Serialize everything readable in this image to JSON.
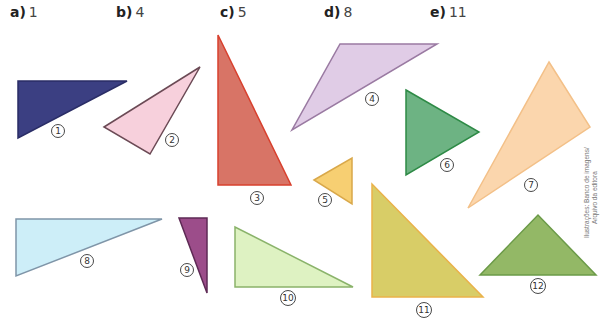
{
  "answers": [
    {
      "letter": "a)",
      "value": "1"
    },
    {
      "letter": "b)",
      "value": "4"
    },
    {
      "letter": "c)",
      "value": "5"
    },
    {
      "letter": "d)",
      "value": "8"
    },
    {
      "letter": "e)",
      "value": "11"
    }
  ],
  "triangles": [
    {
      "id": "1",
      "fill": "#3b3f82",
      "stroke": "#2a2d66",
      "points": "18,81 127,81 18,138",
      "label_x": 58,
      "label_y": 131
    },
    {
      "id": "2",
      "fill": "#f7d0dc",
      "stroke": "#6b4a55",
      "points": "104,127 200,67 150,154",
      "label_x": 172,
      "label_y": 140
    },
    {
      "id": "3",
      "fill": "#d87466",
      "stroke": "#d8402e",
      "points": "218,35 218,185 291,185",
      "label_x": 257,
      "label_y": 198
    },
    {
      "id": "4",
      "fill": "#e0cce6",
      "stroke": "#9a7aa2",
      "points": "340,44 437,44 292,130",
      "label_x": 372,
      "label_y": 99
    },
    {
      "id": "5",
      "fill": "#f7cf72",
      "stroke": "#d9a84a",
      "points": "314,180 352,158 352,204",
      "label_x": 325,
      "label_y": 200
    },
    {
      "id": "6",
      "fill": "#6db383",
      "stroke": "#2e8a46",
      "points": "406,90 479,132 406,175",
      "label_x": 447,
      "label_y": 165
    },
    {
      "id": "7",
      "fill": "#fbd6ad",
      "stroke": "#f3c088",
      "points": "549,62 590,127 468,208",
      "label_x": 531,
      "label_y": 185
    },
    {
      "id": "8",
      "fill": "#cdeef8",
      "stroke": "#7f95a8",
      "points": "16,219 162,219 16,276",
      "label_x": 87,
      "label_y": 261
    },
    {
      "id": "9",
      "fill": "#9c4d8a",
      "stroke": "#5e2a55",
      "points": "179,218 207,218 207,293",
      "label_x": 187,
      "label_y": 270
    },
    {
      "id": "10",
      "fill": "#def2c2",
      "stroke": "#8ab36a",
      "points": "235,227 235,287 353,287",
      "label_x": 288,
      "label_y": 298
    },
    {
      "id": "11",
      "fill": "#d8cd67",
      "stroke": "#eab24a",
      "points": "372,184 372,297 483,297",
      "label_x": 424,
      "label_y": 310
    },
    {
      "id": "12",
      "fill": "#93b866",
      "stroke": "#6b9a48",
      "points": "480,275 538,215 596,275",
      "label_x": 538,
      "label_y": 286
    }
  ],
  "credit": {
    "line1": "Ilustrações: Banco de imagens/",
    "line2": "Arquivo da editora"
  }
}
